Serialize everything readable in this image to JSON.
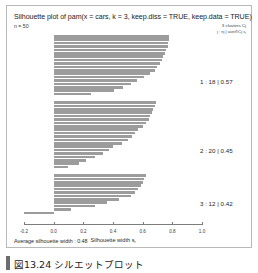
{
  "figure": {
    "title": "Silhouette plot of pam(x = cars, k = 3, keep.diss = TRUE, keep.data = TRUE)",
    "subtitle": "n = 50",
    "legend_line1": "3 clusters Cj",
    "legend_line2_prefix": "j :  nj  |  avei∈Cj  s",
    "legend_line2_sub": "i",
    "average_label": "Average silhouette width : 0.48",
    "caption": "図13.24 シルエットプロット"
  },
  "cluster_labels": [
    "1 :  18  |  0.57",
    "2 :  20  |  0.45",
    "3 :  12  |  0.42"
  ],
  "colors": {
    "bar": "#9c9c9c",
    "axis": "#7d7d7d",
    "frame": "#b9b9b9",
    "text": "#1f1f1f",
    "caption_bar": "#6d6d6d"
  },
  "chart_data": {
    "type": "bar",
    "orientation": "horizontal",
    "title": "Silhouette plot of pam(x = cars, k = 3, keep.diss = TRUE, keep.data = TRUE)",
    "subtitle": "n = 50",
    "xlabel": "Silhouette width si",
    "ylabel": "",
    "xlim": [
      -0.2,
      1.0
    ],
    "xticks": [
      -0.2,
      0.0,
      0.2,
      0.4,
      0.6,
      0.8,
      1.0
    ],
    "xtick_labels": [
      "-0.2",
      "0.0",
      "0.2",
      "0.4",
      "0.6",
      "0.8",
      "1.0"
    ],
    "grid": false,
    "legend_position": "right",
    "n_total": 50,
    "average_silhouette_width": 0.48,
    "clusters": [
      {
        "id": 1,
        "size": 18,
        "average_silhouette_width": 0.57,
        "label": "1 :  18  |  0.57",
        "values": [
          0.78,
          0.78,
          0.77,
          0.77,
          0.76,
          0.75,
          0.74,
          0.73,
          0.72,
          0.7,
          0.68,
          0.65,
          0.61,
          0.56,
          0.52,
          0.47,
          0.41,
          0.25
        ]
      },
      {
        "id": 2,
        "size": 20,
        "average_silhouette_width": 0.45,
        "label": "2 :  20  |  0.45",
        "values": [
          0.69,
          0.68,
          0.67,
          0.66,
          0.65,
          0.64,
          0.62,
          0.6,
          0.57,
          0.55,
          0.53,
          0.5,
          0.46,
          0.4,
          0.37,
          0.33,
          0.28,
          0.22,
          0.17,
          0.1
        ]
      },
      {
        "id": 3,
        "size": 12,
        "average_silhouette_width": 0.42,
        "label": "3 :  12  |  0.42",
        "values": [
          0.62,
          0.61,
          0.6,
          0.59,
          0.57,
          0.55,
          0.52,
          0.44,
          0.36,
          0.28,
          0.12,
          -0.2
        ]
      }
    ]
  }
}
